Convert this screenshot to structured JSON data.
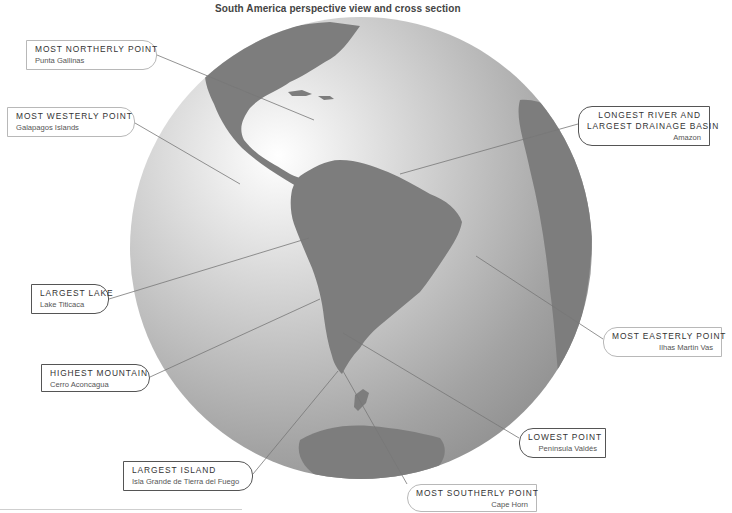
{
  "title": "South America perspective view and cross section",
  "globe": {
    "center": [
      361,
      248
    ],
    "radius": 231,
    "ocean_light": "#ffffff",
    "ocean_dark": "#8c8c8c",
    "land_color": "#7a7a7a"
  },
  "labels": [
    {
      "id": "most-northerly-point",
      "heading": "MOST NORTHERLY POINT",
      "place": "Punta Gallinas",
      "side": "left",
      "style": "light",
      "box": [
        26,
        40,
        131,
        30
      ],
      "leader": [
        [
          157,
          55
        ],
        [
          314,
          120
        ]
      ]
    },
    {
      "id": "most-westerly-point",
      "heading": "MOST WESTERLY POINT",
      "place": "Galapagos Islands",
      "side": "left",
      "style": "light",
      "box": [
        7,
        107,
        128,
        30
      ],
      "leader": [
        [
          135,
          123
        ],
        [
          240,
          184
        ]
      ]
    },
    {
      "id": "longest-river",
      "heading": "LONGEST RIVER AND",
      "heading2": "LARGEST DRAINAGE BASIN",
      "place": "Amazon",
      "side": "right",
      "style": "dark",
      "box": [
        578,
        106,
        132,
        40
      ],
      "leader": [
        [
          578,
          124
        ],
        [
          400,
          174
        ]
      ]
    },
    {
      "id": "largest-lake",
      "heading": "LARGEST LAKE",
      "place": "Lake Titicaca",
      "side": "left",
      "style": "dark",
      "box": [
        31,
        284,
        78,
        30
      ],
      "leader": [
        [
          109,
          299
        ],
        [
          309,
          238
        ]
      ]
    },
    {
      "id": "highest-mountain",
      "heading": "HIGHEST MOUNTAIN",
      "place": "Cerro Aconcagua",
      "side": "left",
      "style": "dark",
      "box": [
        41,
        364,
        109,
        28
      ],
      "leader": [
        [
          150,
          377
        ],
        [
          320,
          299
        ]
      ]
    },
    {
      "id": "most-easterly-point",
      "heading": "MOST EASTERLY POINT",
      "place": "Ilhas Martin Vas",
      "side": "right",
      "style": "light",
      "box": [
        603,
        327,
        119,
        30
      ],
      "leader": [
        [
          603,
          339
        ],
        [
          476,
          256
        ]
      ]
    },
    {
      "id": "lowest-point",
      "heading": "LOWEST POINT",
      "place": "Península Valdés",
      "side": "right",
      "style": "dark",
      "box": [
        519,
        428,
        87,
        30
      ],
      "leader": [
        [
          519,
          438
        ],
        [
          343,
          333
        ]
      ]
    },
    {
      "id": "largest-island",
      "heading": "LARGEST ISLAND",
      "place": "Isla Grande de Tierra del Fuego",
      "side": "left",
      "style": "dark",
      "box": [
        123,
        461,
        130,
        30
      ],
      "leader": [
        [
          253,
          474
        ],
        [
          338,
          371
        ]
      ]
    },
    {
      "id": "most-southerly-point",
      "heading": "MOST SOUTHERLY POINT",
      "place": "Cape Horn",
      "side": "right",
      "style": "light",
      "box": [
        407,
        484,
        130,
        28
      ],
      "leader": [
        [
          407,
          484
        ],
        [
          343,
          371
        ]
      ]
    }
  ]
}
